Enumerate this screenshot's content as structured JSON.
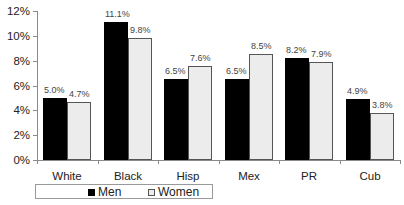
{
  "chart_data": {
    "type": "bar",
    "title": "",
    "xlabel": "",
    "ylabel": "",
    "categories": [
      "White",
      "Black",
      "Hisp",
      "Mex",
      "PR",
      "Cub"
    ],
    "series": [
      {
        "name": "Men",
        "color": "#000000",
        "values": [
          5.0,
          11.1,
          6.5,
          6.5,
          8.2,
          4.9
        ],
        "labels": [
          "5.0%",
          "11.1%",
          "6.5%",
          "6.5%",
          "8.2%",
          "4.9%"
        ]
      },
      {
        "name": "Women",
        "color": "#ececec",
        "values": [
          4.7,
          9.8,
          7.6,
          8.5,
          7.9,
          3.8
        ],
        "labels": [
          "4.7%",
          "9.8%",
          "7.6%",
          "8.5%",
          "7.9%",
          "3.8%"
        ]
      }
    ],
    "ylim": [
      0,
      12
    ],
    "yticks": [
      0,
      2,
      4,
      6,
      8,
      10,
      12
    ],
    "ytick_labels": [
      "0%",
      "2%",
      "4%",
      "6%",
      "8%",
      "10%",
      "12%"
    ],
    "grid": false,
    "legend_position": "bottom"
  },
  "legend": {
    "items": [
      {
        "label": "Men",
        "color": "#000000"
      },
      {
        "label": "Women",
        "color": "#ececec"
      }
    ]
  }
}
